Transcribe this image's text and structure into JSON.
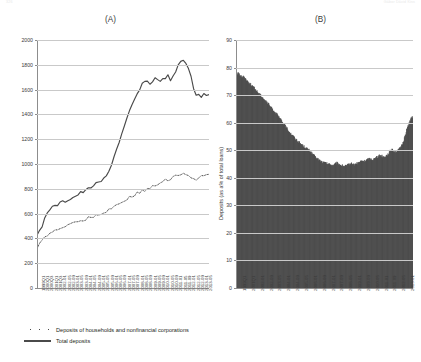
{
  "runheads": {
    "left": "326",
    "right": "Gábor Dávid Kiss"
  },
  "panels": {
    "a_title": "(A)",
    "b_title": "(B)"
  },
  "legend": [
    {
      "marker": "dotted",
      "label": "Deposits of households and nonfinancial corporations"
    },
    {
      "marker": "solid",
      "label": "Total deposits"
    }
  ],
  "chart_data": [
    {
      "id": "A",
      "type": "line",
      "title": "(A)",
      "xlabel": "",
      "ylabel": "",
      "ylim": [
        0,
        2000
      ],
      "yticks": [
        0,
        200,
        400,
        600,
        800,
        1000,
        1200,
        1400,
        1600,
        1800,
        2000
      ],
      "grid": true,
      "legend_position": "below-figure",
      "xtick_labels": [
        "1999Q1",
        "2000Q1",
        "2000Q3",
        "2001Q1",
        "2001Q3",
        "2002-01",
        "2002-05",
        "2002-09",
        "2003-01",
        "2003-05",
        "2003-09",
        "2004-01",
        "2004-05",
        "2004-09",
        "2005-01",
        "2005-05",
        "2005-09",
        "2006-01",
        "2006-05",
        "2006-09",
        "2007-01",
        "2007-05",
        "2007-09",
        "2008-01",
        "2008-05",
        "2008-09",
        "2009-01",
        "2009-05",
        "2009-09",
        "2010-01",
        "2010-05",
        "2010-09",
        "2011-01",
        "2011-05",
        "2011-09",
        "2012-01",
        "2012-05",
        "2012-09",
        "2013-01",
        "2013-05"
      ],
      "series": [
        {
          "name": "Total deposits",
          "style": "solid",
          "values": [
            420,
            455,
            500,
            560,
            610,
            640,
            650,
            660,
            672,
            685,
            695,
            700,
            712,
            722,
            730,
            742,
            755,
            768,
            775,
            785,
            800,
            815,
            828,
            838,
            848,
            862,
            878,
            900,
            940,
            1000,
            1060,
            1120,
            1180,
            1240,
            1300,
            1360,
            1420,
            1470,
            1520,
            1560,
            1600,
            1640,
            1660,
            1680,
            1640,
            1660,
            1700,
            1690,
            1660,
            1680,
            1700,
            1710,
            1680,
            1700,
            1740,
            1790,
            1830,
            1840,
            1810,
            1780,
            1700,
            1600,
            1555,
            1560,
            1545,
            1575,
            1560,
            1565
          ]
        },
        {
          "name": "Deposits of households and nonfinancial corporations",
          "style": "dotted",
          "values": [
            320,
            350,
            380,
            405,
            430,
            445,
            455,
            465,
            472,
            480,
            490,
            498,
            505,
            512,
            520,
            528,
            535,
            542,
            550,
            558,
            565,
            572,
            580,
            588,
            596,
            604,
            612,
            622,
            632,
            645,
            658,
            670,
            682,
            694,
            706,
            718,
            728,
            740,
            752,
            762,
            772,
            782,
            790,
            800,
            812,
            822,
            830,
            838,
            848,
            858,
            868,
            876,
            884,
            892,
            900,
            908,
            915,
            920,
            918,
            912,
            900,
            888,
            880,
            890,
            900,
            910,
            915,
            918
          ]
        }
      ]
    },
    {
      "id": "B",
      "type": "area",
      "title": "(B)",
      "xlabel": "",
      "ylabel": "Deposits (as a% of total loans)",
      "ylim": [
        0,
        90
      ],
      "yticks": [
        0,
        10,
        20,
        30,
        40,
        50,
        60,
        70,
        80,
        90
      ],
      "grid": true,
      "xtick_labels": [
        "1999Q1",
        "2001Q1",
        "2002-01",
        "2002-09",
        "2003-05",
        "2004-01",
        "2004-09",
        "2005-05",
        "2006-01",
        "2006-09",
        "2007-01",
        "2007-09",
        "2008-05",
        "2009-01",
        "2009-09",
        "2010-05",
        "2011-01",
        "2011-09",
        "2012-05",
        "2013-01"
      ],
      "values": [
        77.5,
        78.0,
        77.2,
        76.5,
        76.8,
        75.6,
        74.8,
        74.0,
        73.4,
        72.6,
        71.8,
        71.0,
        70.2,
        69.5,
        68.6,
        67.8,
        67.0,
        66.1,
        65.2,
        64.4,
        63.5,
        62.6,
        61.6,
        60.6,
        59.6,
        58.6,
        57.6,
        56.6,
        55.8,
        55.0,
        54.2,
        53.5,
        52.8,
        52.2,
        51.6,
        51.0,
        50.5,
        50.0,
        49.2,
        48.4,
        47.6,
        47.0,
        46.5,
        46.0,
        45.6,
        45.4,
        45.2,
        45.0,
        44.8,
        44.6,
        44.9,
        45.4,
        45.0,
        44.6,
        44.4,
        44.2,
        44.4,
        44.8,
        45.2,
        45.0,
        44.8,
        45.1,
        45.5,
        45.9,
        46.2,
        46.0,
        46.4,
        46.8,
        47.0,
        46.6,
        46.9,
        47.3,
        47.8,
        48.2,
        48.0,
        47.6,
        48.0,
        48.6,
        49.5,
        50.6,
        49.8,
        49.4,
        49.8,
        50.6,
        51.8,
        53.5,
        56.0,
        58.5,
        60.5,
        61.8,
        62.0
      ]
    }
  ]
}
